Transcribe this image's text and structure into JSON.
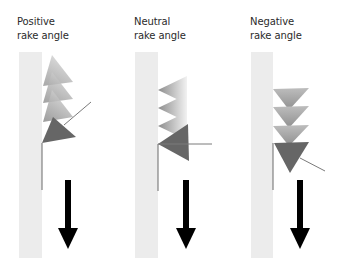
{
  "panels": [
    {
      "id": "positive",
      "title_line1": "Positive",
      "title_line2": "rake angle"
    },
    {
      "id": "neutral",
      "title_line1": "Neutral",
      "title_line2": "rake angle"
    },
    {
      "id": "negative",
      "title_line1": "Negative",
      "title_line2": "rake angle"
    }
  ],
  "colors": {
    "workpiece": "#ececec",
    "tool_dark": "#6a6a6a",
    "tool_light": "#b8b8b8",
    "arrow": "#000000",
    "line": "#7a7a7a"
  }
}
